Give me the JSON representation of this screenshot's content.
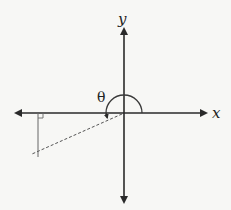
{
  "diagram": {
    "type": "coordinate-plane-angle",
    "labels": {
      "x_axis": "x",
      "y_axis": "y",
      "angle": "θ"
    },
    "colors": {
      "background": "#f7f7f5",
      "axis": "#2a2a2a",
      "arc": "#3a3a3a",
      "terminal_side": "#555555",
      "perpendicular": "#666666"
    },
    "geometry": {
      "origin": [
        124,
        113
      ],
      "arc_radius": 18,
      "terminal_side_end": [
        32,
        154
      ],
      "perpendicular_x": 38
    }
  }
}
